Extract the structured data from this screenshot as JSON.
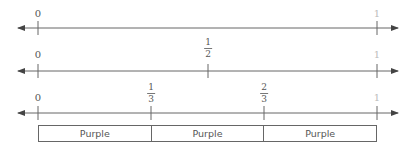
{
  "number_lines": [
    {
      "id": "whole",
      "labels": {
        "start": "0",
        "end": "1"
      },
      "fractions": []
    },
    {
      "id": "halves",
      "labels": {
        "start": "0",
        "end": "1"
      },
      "fractions": [
        {
          "num": "1",
          "den": "2"
        }
      ]
    },
    {
      "id": "thirds",
      "labels": {
        "start": "0",
        "end": "1"
      },
      "fractions": [
        {
          "num": "1",
          "den": "3"
        },
        {
          "num": "2",
          "den": "3"
        }
      ]
    }
  ],
  "fraction_bar": {
    "segments": [
      "Purple",
      "Purple",
      "Purple"
    ]
  },
  "colors": {
    "line": "#555555",
    "box_border": "#666666",
    "text": "#555555"
  }
}
